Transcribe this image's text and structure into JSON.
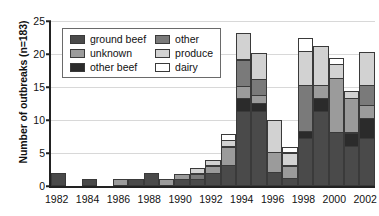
{
  "chart_data": {
    "type": "bar",
    "subtype": "stacked-bar",
    "title": "",
    "xlabel": "",
    "ylabel": "Number of outbreaks (n=183)",
    "ylim": [
      0,
      25
    ],
    "yticks": [
      0,
      5,
      10,
      15,
      20,
      25
    ],
    "grid": true,
    "legend_position": "upper-left-inside",
    "categories": [
      "1982",
      "1983",
      "1984",
      "1985",
      "1986",
      "1987",
      "1988",
      "1989",
      "1990",
      "1991",
      "1992",
      "1993",
      "1994",
      "1995",
      "1996",
      "1997",
      "1998",
      "1999",
      "2000",
      "2001",
      "2002"
    ],
    "tick_labels": [
      "1982",
      "",
      "1984",
      "",
      "1986",
      "",
      "1988",
      "",
      "1990",
      "",
      "1992",
      "",
      "1994",
      "",
      "1996",
      "",
      "1998",
      "",
      "2000",
      "",
      "2002"
    ],
    "series": [
      {
        "name": "ground beef",
        "color": "#4a4a4a",
        "values": [
          2,
          0,
          1,
          0,
          0,
          1,
          2,
          0,
          1,
          1,
          2,
          3.2,
          11.4,
          11.4,
          2.1,
          1.2,
          7.2,
          11.3,
          8.2,
          6.1,
          7.3
        ]
      },
      {
        "name": "other beef",
        "color": "#2b2b2b",
        "values": [
          0,
          0,
          0,
          0,
          0,
          0,
          0,
          0,
          0,
          0,
          0,
          0,
          2.0,
          1.3,
          0,
          0,
          1.2,
          2.1,
          0,
          2.1,
          3.1
        ]
      },
      {
        "name": "unknown",
        "color": "#9b9b9b",
        "values": [
          0,
          0,
          0,
          0,
          1,
          0,
          0,
          1,
          1,
          0,
          1.2,
          2.9,
          2.0,
          1.3,
          3.1,
          2.0,
          0,
          2.1,
          8.3,
          5.3,
          2.1
        ]
      },
      {
        "name": "other",
        "color": "#7a7a7a",
        "values": [
          0,
          0,
          0,
          0,
          0,
          0,
          0,
          0,
          0,
          1,
          0,
          0,
          4.1,
          2.5,
          0,
          0,
          7.1,
          0,
          0,
          0,
          3.1
        ]
      },
      {
        "name": "produce",
        "color": "#d2d2d2",
        "values": [
          0,
          0,
          0,
          0,
          0,
          0,
          0,
          0,
          0,
          1,
          1,
          1.1,
          4.2,
          4.1,
          5.1,
          2.1,
          5.3,
          6.1,
          2.2,
          1.2,
          5.1
        ]
      },
      {
        "name": "dairy",
        "color": "#ffffff",
        "values": [
          0,
          0,
          0,
          0,
          0,
          0,
          0,
          0,
          0,
          0,
          0,
          1.0,
          0,
          0,
          0,
          1.0,
          2.1,
          0,
          1.0,
          0,
          0
        ]
      }
    ],
    "totals": [
      2,
      0,
      1,
      0,
      1,
      1,
      2,
      1,
      2,
      3,
      4.2,
      10.3,
      23.7,
      20.6,
      10.3,
      6.3,
      22.9,
      21.6,
      19.7,
      14.7,
      20.7
    ]
  },
  "legend": {
    "items": [
      {
        "label": "ground beef",
        "swatch": "#4a4a4a"
      },
      {
        "label": "other",
        "swatch": "#7a7a7a"
      },
      {
        "label": "unknown",
        "swatch": "#9b9b9b"
      },
      {
        "label": "produce",
        "swatch": "#d2d2d2"
      },
      {
        "label": "other beef",
        "swatch": "#2b2b2b"
      },
      {
        "label": "dairy",
        "swatch": "#ffffff"
      }
    ]
  },
  "axis": {
    "y_title": "Number of outbreaks (n=183)",
    "y_tick_labels": [
      "0",
      "5",
      "10",
      "15",
      "20",
      "25"
    ]
  }
}
